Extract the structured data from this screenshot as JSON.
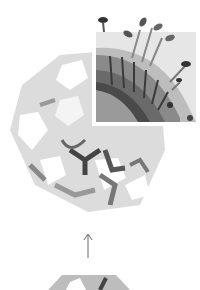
{
  "figure": {
    "colors": {
      "background": "#ffffff",
      "light_gray": "#d8d8d8",
      "mid_gray": "#a8a8a8",
      "dark_gray": "#5a5a5a",
      "darkest": "#333333",
      "arrow": "#6a6a6a"
    },
    "arrow": {
      "direction": "up"
    }
  }
}
